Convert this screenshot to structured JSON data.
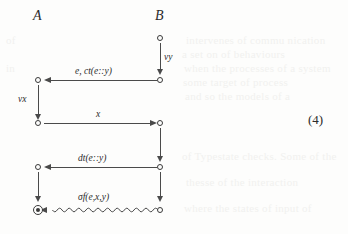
{
  "figure": {
    "kind": "message-sequence-diagram",
    "equation_number": "(4)",
    "ink_color": "#4a4a4a",
    "text_color": "#2b2b2b",
    "background_color": "#fdfdfc",
    "columns": [
      {
        "id": "A",
        "label": "A"
      },
      {
        "id": "B",
        "label": "B"
      }
    ],
    "vertical_edges": [
      {
        "id": "b-vy",
        "column": "B",
        "label": "vy"
      },
      {
        "id": "a-vx",
        "column": "A",
        "label": "vx"
      },
      {
        "id": "b-seg2",
        "column": "B",
        "label": ""
      },
      {
        "id": "a-seg2",
        "column": "A",
        "label": ""
      },
      {
        "id": "b-seg3",
        "column": "B",
        "label": ""
      },
      {
        "id": "a-seg3",
        "column": "A",
        "label": ""
      }
    ],
    "horizontal_edges": [
      {
        "id": "msg-1",
        "label": "e, ct(e::y)",
        "direction": "right-to-left",
        "style": "straight"
      },
      {
        "id": "msg-2",
        "label": "x",
        "direction": "left-to-right",
        "style": "straight"
      },
      {
        "id": "msg-3",
        "label": "dt(e::y)",
        "direction": "right-to-left",
        "style": "straight"
      },
      {
        "id": "msg-4",
        "label": "σf(e,x,y)",
        "direction": "right-to-left",
        "style": "wavy"
      }
    ],
    "terminal_node": {
      "id": "a-final",
      "column": "A",
      "shape": "circle-with-dot"
    }
  },
  "bleed_through_text": {
    "line_1": "intervenes of commu nication",
    "line_2": "a set on of behaviours",
    "line_3": "when the processes of a system",
    "line_4": "some target of process",
    "line_5": "and so the models of a",
    "line_6": "of Typestate checks. Some of the",
    "line_7": "thesse of the interaction",
    "line_8": "where the states of input of"
  }
}
